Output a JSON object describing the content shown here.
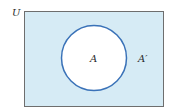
{
  "diagram": {
    "type": "venn",
    "universe_label": "U",
    "set_label": "A",
    "complement_label": "A′",
    "colors": {
      "universe_fill": "#d6ebf5",
      "universe_border": "#6e6e6e",
      "set_fill": "#ffffff",
      "set_border": "#3a72b8"
    }
  }
}
